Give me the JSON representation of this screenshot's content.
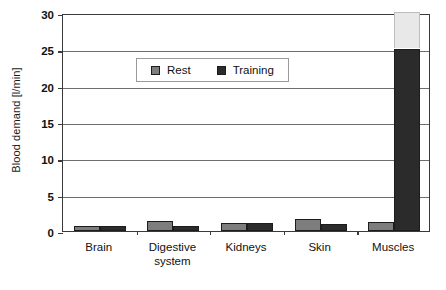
{
  "chart_data": {
    "type": "bar",
    "title": "",
    "xlabel": "",
    "ylabel": "Blood demand [l/min]",
    "categories": [
      "Brain",
      "Digestive system",
      "Kidneys",
      "Skin",
      "Muscles"
    ],
    "category_lines": [
      [
        "Brain"
      ],
      [
        "Digestive",
        "system"
      ],
      [
        "Kidneys"
      ],
      [
        "Skin"
      ],
      [
        "Muscles"
      ]
    ],
    "series": [
      {
        "name": "Rest",
        "color": "#7d7d7d",
        "values": [
          0.75,
          1.4,
          1.1,
          1.6,
          1.2
        ]
      },
      {
        "name": "Training",
        "color": "#2b2b2b",
        "values": [
          0.75,
          0.7,
          1.1,
          1.0,
          25.0
        ]
      }
    ],
    "annotations": [
      {
        "name": "muscles-training-overflow",
        "category": "Muscles",
        "series": "Training",
        "from": 25.0,
        "to": 30.0,
        "color": "#e8e8e8"
      }
    ],
    "ylim": [
      0,
      30
    ],
    "yticks": [
      0,
      5,
      10,
      15,
      20,
      25,
      30
    ],
    "ytick_labels": [
      "0",
      "5",
      "10",
      "15",
      "20",
      "25",
      "30"
    ],
    "grid": true,
    "legend_position": "top-center"
  },
  "legend": {
    "items": [
      {
        "label": "Rest",
        "swatch": "#7d7d7d"
      },
      {
        "label": "Training",
        "swatch": "#2b2b2b"
      }
    ]
  },
  "axis": {
    "y_title": "Blood demand [l/min]"
  }
}
